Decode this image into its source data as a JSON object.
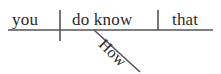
{
  "diagram": {
    "kind": "reed-kellogg-sentence-diagram",
    "sentence": "How do you know that",
    "background_color": "#ffffff",
    "line_color": "#555555",
    "text_color": "#2b2b2b",
    "baseline": {
      "label": "baseline",
      "x1": 8,
      "y1": 30,
      "x2": 213,
      "y2": 30
    },
    "dividers": [
      {
        "name": "subject-predicate-divider",
        "style": "full",
        "x": 60,
        "y1": 10,
        "y2": 41
      },
      {
        "name": "verb-object-divider",
        "style": "half",
        "x": 158,
        "y1": 10,
        "y2": 30
      }
    ],
    "modifier_line": {
      "name": "modifier-slant-line",
      "x1": 94,
      "y1": 30,
      "x2": 140,
      "y2": 72
    },
    "words": {
      "subject": "you",
      "verb": "do know",
      "object": "that",
      "modifier": "How"
    },
    "roles": {
      "subject": "subject",
      "verb": "verb",
      "object": "direct object",
      "modifier": "adverb modifier"
    }
  }
}
